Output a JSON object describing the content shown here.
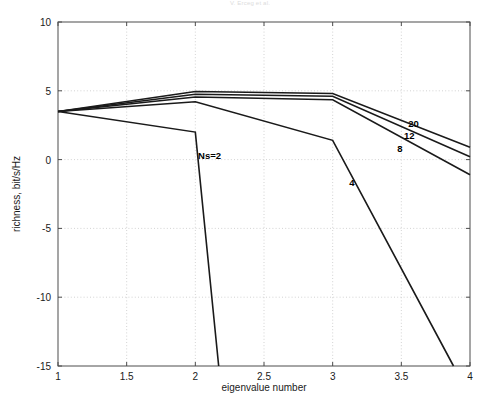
{
  "figure": {
    "header_faint_text": "V. Erceg et al.",
    "corner_mark": ""
  },
  "chart_data": {
    "type": "line",
    "title": "",
    "xlabel": "eigenvalue number",
    "ylabel": "richness, bit/s/Hz",
    "xlim": [
      1,
      4
    ],
    "ylim": [
      -15,
      10
    ],
    "xticks": [
      1,
      1.5,
      2,
      2.5,
      3,
      3.5,
      4
    ],
    "xticklabels": [
      "1",
      "1.5",
      "2",
      "2.5",
      "3",
      "3.5",
      "4"
    ],
    "yticks": [
      10,
      5,
      0,
      -5,
      -10,
      -15
    ],
    "yticklabels": [
      "10",
      "5",
      "0",
      "-5",
      "-10",
      "-15"
    ],
    "grid": true,
    "legend_position": "inline-annotations",
    "x": [
      1,
      2,
      3,
      4
    ],
    "series": [
      {
        "name": "Ns=2",
        "label": "Ns=2",
        "label_x": 2.02,
        "label_y": 0.05,
        "values": [
          3.5,
          2.0,
          -15.0,
          null
        ],
        "clip_x": 2.17
      },
      {
        "name": "Ns=4",
        "label": "4",
        "label_x": 3.12,
        "label_y": -1.9,
        "values": [
          3.5,
          4.2,
          1.4,
          -15.0
        ],
        "clip_x": 3.88
      },
      {
        "name": "Ns=8",
        "label": "8",
        "label_x": 3.47,
        "label_y": 0.55,
        "values": [
          3.5,
          4.55,
          4.35,
          -1.1
        ]
      },
      {
        "name": "Ns=12",
        "label": "12",
        "label_x": 3.52,
        "label_y": 1.5,
        "values": [
          3.5,
          4.75,
          4.6,
          0.2
        ]
      },
      {
        "name": "Ns=20",
        "label": "20",
        "label_x": 3.55,
        "label_y": 2.35,
        "values": [
          3.5,
          4.95,
          4.8,
          0.9
        ]
      }
    ]
  }
}
